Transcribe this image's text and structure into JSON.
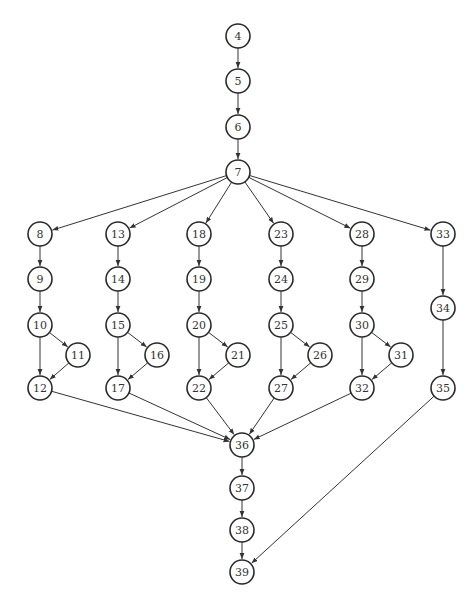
{
  "diagram": {
    "type": "control-flow-graph",
    "node_radius": 12,
    "colors": {
      "stroke": "#2a2a2a",
      "edge": "#333333",
      "label": "#333333",
      "background": "#ffffff"
    },
    "nodes": [
      {
        "id": "4",
        "x": 238,
        "y": 36
      },
      {
        "id": "5",
        "x": 238,
        "y": 81
      },
      {
        "id": "6",
        "x": 238,
        "y": 127
      },
      {
        "id": "7",
        "x": 238,
        "y": 172
      },
      {
        "id": "8",
        "x": 40,
        "y": 234
      },
      {
        "id": "9",
        "x": 40,
        "y": 279
      },
      {
        "id": "10",
        "x": 40,
        "y": 325
      },
      {
        "id": "11",
        "x": 78,
        "y": 355
      },
      {
        "id": "12",
        "x": 40,
        "y": 388
      },
      {
        "id": "13",
        "x": 118,
        "y": 234
      },
      {
        "id": "14",
        "x": 118,
        "y": 279
      },
      {
        "id": "15",
        "x": 118,
        "y": 325
      },
      {
        "id": "16",
        "x": 157,
        "y": 355
      },
      {
        "id": "17",
        "x": 118,
        "y": 388
      },
      {
        "id": "18",
        "x": 199,
        "y": 234
      },
      {
        "id": "19",
        "x": 199,
        "y": 279
      },
      {
        "id": "20",
        "x": 199,
        "y": 325
      },
      {
        "id": "21",
        "x": 238,
        "y": 355
      },
      {
        "id": "22",
        "x": 199,
        "y": 388
      },
      {
        "id": "23",
        "x": 281,
        "y": 234
      },
      {
        "id": "24",
        "x": 281,
        "y": 279
      },
      {
        "id": "25",
        "x": 281,
        "y": 325
      },
      {
        "id": "26",
        "x": 320,
        "y": 355
      },
      {
        "id": "27",
        "x": 281,
        "y": 388
      },
      {
        "id": "28",
        "x": 362,
        "y": 234
      },
      {
        "id": "29",
        "x": 362,
        "y": 279
      },
      {
        "id": "30",
        "x": 362,
        "y": 325
      },
      {
        "id": "31",
        "x": 401,
        "y": 355
      },
      {
        "id": "32",
        "x": 362,
        "y": 388
      },
      {
        "id": "33",
        "x": 443,
        "y": 234
      },
      {
        "id": "34",
        "x": 443,
        "y": 308
      },
      {
        "id": "35",
        "x": 443,
        "y": 388
      },
      {
        "id": "36",
        "x": 242,
        "y": 445
      },
      {
        "id": "37",
        "x": 242,
        "y": 488
      },
      {
        "id": "38",
        "x": 242,
        "y": 530
      },
      {
        "id": "39",
        "x": 242,
        "y": 572
      }
    ],
    "edges": [
      [
        "4",
        "5"
      ],
      [
        "5",
        "6"
      ],
      [
        "6",
        "7"
      ],
      [
        "7",
        "8"
      ],
      [
        "7",
        "13"
      ],
      [
        "7",
        "18"
      ],
      [
        "7",
        "23"
      ],
      [
        "7",
        "28"
      ],
      [
        "7",
        "33"
      ],
      [
        "8",
        "9"
      ],
      [
        "9",
        "10"
      ],
      [
        "10",
        "11"
      ],
      [
        "10",
        "12"
      ],
      [
        "11",
        "12"
      ],
      [
        "13",
        "14"
      ],
      [
        "14",
        "15"
      ],
      [
        "15",
        "16"
      ],
      [
        "15",
        "17"
      ],
      [
        "16",
        "17"
      ],
      [
        "18",
        "19"
      ],
      [
        "19",
        "20"
      ],
      [
        "20",
        "21"
      ],
      [
        "20",
        "22"
      ],
      [
        "21",
        "22"
      ],
      [
        "23",
        "24"
      ],
      [
        "24",
        "25"
      ],
      [
        "25",
        "26"
      ],
      [
        "25",
        "27"
      ],
      [
        "26",
        "27"
      ],
      [
        "28",
        "29"
      ],
      [
        "29",
        "30"
      ],
      [
        "30",
        "31"
      ],
      [
        "30",
        "32"
      ],
      [
        "31",
        "32"
      ],
      [
        "33",
        "34"
      ],
      [
        "34",
        "35"
      ],
      [
        "12",
        "36"
      ],
      [
        "17",
        "36"
      ],
      [
        "22",
        "36"
      ],
      [
        "27",
        "36"
      ],
      [
        "32",
        "36"
      ],
      [
        "36",
        "37"
      ],
      [
        "37",
        "38"
      ],
      [
        "38",
        "39"
      ],
      [
        "35",
        "39"
      ]
    ]
  },
  "caption": ""
}
